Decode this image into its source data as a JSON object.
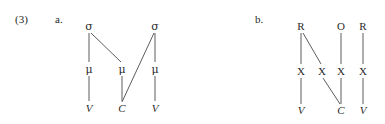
{
  "figure": {
    "example_number": "(3)",
    "parts": [
      {
        "key": "a",
        "label": "a."
      },
      {
        "key": "b",
        "label": "b."
      }
    ]
  },
  "diagram_a": {
    "caption": "a.",
    "tiers": {
      "syllable": {
        "name": "sigma-tier",
        "labels": [
          "σ",
          "σ"
        ]
      },
      "mora": {
        "name": "mu-tier",
        "labels": [
          "μ",
          "μ",
          "μ"
        ]
      },
      "segment": {
        "name": "segment-tier",
        "labels": [
          "V",
          "C",
          "V"
        ]
      }
    },
    "nodes": [
      {
        "id": "s1",
        "label": "σ",
        "tier": "syllable",
        "x": 89,
        "y": 26,
        "style": "greek"
      },
      {
        "id": "s2",
        "label": "σ",
        "tier": "syllable",
        "x": 155,
        "y": 26,
        "style": "greek"
      },
      {
        "id": "m1",
        "label": "μ",
        "tier": "mora",
        "x": 89,
        "y": 69,
        "style": "greek"
      },
      {
        "id": "m2",
        "label": "μ",
        "tier": "mora",
        "x": 122,
        "y": 69,
        "style": "greek"
      },
      {
        "id": "m3",
        "label": "μ",
        "tier": "mora",
        "x": 155,
        "y": 69,
        "style": "greek"
      },
      {
        "id": "v1",
        "label": "V",
        "tier": "segment",
        "x": 89,
        "y": 108,
        "style": "italic"
      },
      {
        "id": "c1",
        "label": "C",
        "tier": "segment",
        "x": 122,
        "y": 108,
        "style": "italic"
      },
      {
        "id": "v2",
        "label": "V",
        "tier": "segment",
        "x": 155,
        "y": 108,
        "style": "italic"
      }
    ],
    "edges": [
      {
        "from": "s1",
        "to": "m1",
        "x1": 89,
        "y1": 33,
        "x2": 89,
        "y2": 62
      },
      {
        "from": "s1",
        "to": "m2",
        "x1": 91,
        "y1": 33,
        "x2": 121,
        "y2": 62
      },
      {
        "from": "s2",
        "to": "m3",
        "x1": 155,
        "y1": 33,
        "x2": 155,
        "y2": 62
      },
      {
        "from": "s2",
        "to": "c1",
        "x1": 154,
        "y1": 33,
        "x2": 122,
        "y2": 102
      },
      {
        "from": "m1",
        "to": "v1",
        "x1": 89,
        "y1": 76,
        "x2": 89,
        "y2": 101
      },
      {
        "from": "m2",
        "to": "c1",
        "x1": 122,
        "y1": 76,
        "x2": 122,
        "y2": 101
      },
      {
        "from": "m3",
        "to": "v2",
        "x1": 155,
        "y1": 76,
        "x2": 155,
        "y2": 101
      }
    ]
  },
  "diagram_b": {
    "caption": "b.",
    "tiers": {
      "constituent": {
        "name": "rhyme-onset-tier",
        "labels": [
          "R",
          "O",
          "R"
        ]
      },
      "skeleton": {
        "name": "x-slot-tier",
        "labels": [
          "X",
          "X",
          "X",
          "X"
        ]
      },
      "segment": {
        "name": "segment-tier",
        "labels": [
          "V",
          "C",
          "V"
        ]
      }
    },
    "nodes": [
      {
        "id": "r1",
        "label": "R",
        "tier": "constituent",
        "x": 301,
        "y": 26,
        "style": "plain"
      },
      {
        "id": "o1",
        "label": "O",
        "tier": "constituent",
        "x": 341,
        "y": 26,
        "style": "plain"
      },
      {
        "id": "r2",
        "label": "R",
        "tier": "constituent",
        "x": 363,
        "y": 26,
        "style": "plain"
      },
      {
        "id": "x1",
        "label": "X",
        "tier": "skeleton",
        "x": 301,
        "y": 71,
        "style": "plain"
      },
      {
        "id": "x2",
        "label": "X",
        "tier": "skeleton",
        "x": 322,
        "y": 71,
        "style": "plain"
      },
      {
        "id": "x3",
        "label": "X",
        "tier": "skeleton",
        "x": 341,
        "y": 71,
        "style": "plain"
      },
      {
        "id": "x4",
        "label": "X",
        "tier": "skeleton",
        "x": 363,
        "y": 71,
        "style": "plain"
      },
      {
        "id": "bv1",
        "label": "V",
        "tier": "segment",
        "x": 301,
        "y": 110,
        "style": "italic"
      },
      {
        "id": "bc1",
        "label": "C",
        "tier": "segment",
        "x": 341,
        "y": 110,
        "style": "italic"
      },
      {
        "id": "bv2",
        "label": "V",
        "tier": "segment",
        "x": 363,
        "y": 110,
        "style": "italic"
      }
    ],
    "edges": [
      {
        "from": "r1",
        "to": "x1",
        "x1": 301,
        "y1": 33,
        "x2": 301,
        "y2": 64
      },
      {
        "from": "r1",
        "to": "x2",
        "x1": 303,
        "y1": 33,
        "x2": 321,
        "y2": 64
      },
      {
        "from": "o1",
        "to": "x3",
        "x1": 341,
        "y1": 33,
        "x2": 341,
        "y2": 64
      },
      {
        "from": "r2",
        "to": "x4",
        "x1": 363,
        "y1": 33,
        "x2": 363,
        "y2": 64
      },
      {
        "from": "x1",
        "to": "bv1",
        "x1": 301,
        "y1": 78,
        "x2": 301,
        "y2": 104
      },
      {
        "from": "x2",
        "to": "bc1",
        "x1": 323,
        "y1": 78,
        "x2": 340,
        "y2": 104
      },
      {
        "from": "x3",
        "to": "bc1",
        "x1": 341,
        "y1": 78,
        "x2": 341,
        "y2": 104
      },
      {
        "from": "x4",
        "to": "bv2",
        "x1": 363,
        "y1": 78,
        "x2": 363,
        "y2": 104
      }
    ]
  },
  "colors": {
    "background": "#ffffff",
    "text": "#262626",
    "edge": "#4a4a4a"
  }
}
